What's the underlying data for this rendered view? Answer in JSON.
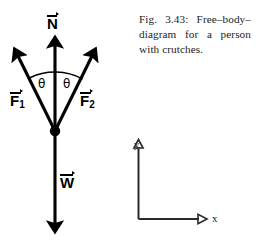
{
  "figure": {
    "caption": "Fig. 3.43: Free–body–diagram for a person with crutches.",
    "title_ref": "Fig. 3.43"
  },
  "diagram": {
    "type": "free-body-diagram",
    "subject": "person with crutches",
    "vertex_label": "",
    "vectors": [
      {
        "id": "N",
        "symbol": "N",
        "subscript": "",
        "label": "N",
        "direction": "up",
        "meaning": "normal force"
      },
      {
        "id": "F1",
        "symbol": "F",
        "subscript": "1",
        "label": "F1",
        "direction": "up-left",
        "meaning": "crutch force left"
      },
      {
        "id": "F2",
        "symbol": "F",
        "subscript": "2",
        "label": "F2",
        "direction": "up-right",
        "meaning": "crutch force right"
      },
      {
        "id": "W",
        "symbol": "W",
        "subscript": "",
        "label": "W",
        "direction": "down",
        "meaning": "weight"
      }
    ],
    "angles": [
      {
        "id": "theta-left",
        "label": "θ",
        "between": "F1 and N"
      },
      {
        "id": "theta-right",
        "label": "θ",
        "between": "N and F2"
      }
    ],
    "colors": {
      "ink": "#000000",
      "background": "#ffffff",
      "axis_ink": "#222222"
    }
  },
  "axes": {
    "x_label": "x",
    "y_label": "y",
    "origin_label": ""
  }
}
